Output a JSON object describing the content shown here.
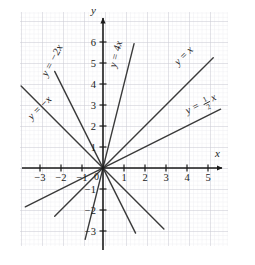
{
  "figure": {
    "name": "coordinate-plane-linear-functions",
    "background": "#ffffff",
    "grid": {
      "minor_color": "#e3e3e8",
      "major_color": "#c9c9d2",
      "minor_step_px": 4.2,
      "major_step_px": 21,
      "left_px": 20,
      "right_px": 228,
      "top_px": 12,
      "bottom_px": 246,
      "visible": true
    },
    "axes": {
      "color": "#1a1a1a",
      "origin_px": [
        103,
        168
      ],
      "unit_px": 21,
      "x_label": "x",
      "y_label": "y",
      "origin_label": "0",
      "x_ticks": [
        -3,
        -2,
        -1,
        1,
        2,
        3,
        4,
        5
      ],
      "x_tick_labels": [
        "-3",
        "-2",
        "-1",
        "1",
        "2",
        "3",
        "4",
        "5"
      ],
      "y_ticks": [
        -3,
        -2,
        -1,
        1,
        2,
        3,
        4,
        5,
        6
      ],
      "y_tick_labels": [
        "-3",
        "-2",
        "-1",
        "1",
        "2",
        "3",
        "4",
        "5",
        "6"
      ],
      "x_range": [
        -4,
        6
      ],
      "y_range": [
        -3.7,
        7.4
      ]
    }
  },
  "chart_data": {
    "type": "line",
    "title": "",
    "xlabel": "x",
    "ylabel": "y",
    "xlim": [
      -4,
      6
    ],
    "ylim": [
      -3.7,
      7.4
    ],
    "grid": true,
    "legend": "inline-labels",
    "line_color": "#3a3a3a",
    "series": [
      {
        "name": "y = -2x",
        "label": "y = −2x",
        "slope": -2,
        "intercept": 0,
        "label_pos_px": [
          55,
          62
        ],
        "label_rotation_deg": -62,
        "x_start": -2.3,
        "x_end": 1.55
      },
      {
        "name": "y = -x",
        "label": "y = −x",
        "slope": -1,
        "intercept": 0,
        "label_pos_px": [
          42,
          110
        ],
        "label_rotation_deg": -45,
        "x_start": -3.9,
        "x_end": 2.9
      },
      {
        "name": "y = 4x",
        "label": "y = 4x",
        "slope": 4,
        "intercept": 0,
        "label_pos_px": [
          119,
          55
        ],
        "label_rotation_deg": -76,
        "x_start": -0.85,
        "x_end": 1.48
      },
      {
        "name": "y = x",
        "label": "y = x",
        "slope": 1,
        "intercept": 0,
        "label_pos_px": [
          186,
          58
        ],
        "label_rotation_deg": -45,
        "x_start": -2.3,
        "x_end": 5.25
      },
      {
        "name": "y = 1/2 x",
        "label_prefix": "y = ",
        "label_numerator": "1",
        "label_denominator": "2",
        "label_suffix": "x",
        "label": "y = ½x",
        "slope": 0.5,
        "intercept": 0,
        "label_pos_px": [
          194,
          111
        ],
        "label_rotation_deg": -27,
        "x_start": -3.7,
        "x_end": 5.6
      }
    ]
  }
}
